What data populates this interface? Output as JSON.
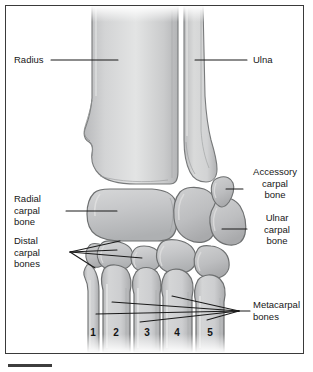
{
  "figure": {
    "background_color": "#ffffff",
    "frame_color": "#3a3a3a",
    "bone_fill": "#c9cacb",
    "bone_fill_light": "#dcdddd",
    "bone_outline": "#6e7071",
    "leader_color": "#1a1a1a",
    "label_color": "#171717"
  },
  "labels": {
    "radius": "Radius",
    "ulna": "Ulna",
    "accessory_carpal_bone": "Accessory\ncarpal\nbone",
    "ulnar_carpal_bone": "Ulnar\ncarpal\nbone",
    "radial_carpal_bone": "Radial\ncarpal\nbone",
    "distal_carpal_bones": "Distal\ncarpal\nbones",
    "metacarpal_bones": "Metacarpal\nbones"
  },
  "metacarpal_numbers": [
    {
      "id": "metacarpal-1",
      "text": "1"
    },
    {
      "id": "metacarpal-2",
      "text": "2"
    },
    {
      "id": "metacarpal-3",
      "text": "3"
    },
    {
      "id": "metacarpal-4",
      "text": "4"
    },
    {
      "id": "metacarpal-5",
      "text": "5"
    }
  ]
}
